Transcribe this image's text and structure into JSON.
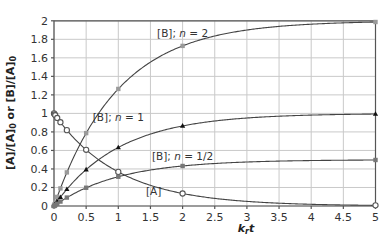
{
  "chart_data": {
    "type": "line",
    "title": "",
    "xlabel": "k_r t",
    "ylabel": "[A]/[A]0 or [B]/[A]0",
    "xlim": [
      0,
      5
    ],
    "ylim": [
      0,
      2
    ],
    "grid": true,
    "legend_position": "none (inline annotations)",
    "x_ticks": [
      "0",
      "0.5",
      "1",
      "1.5",
      "2",
      "2.5",
      "3",
      "3.5",
      "4",
      "4.5",
      "5"
    ],
    "y_ticks": [
      "0",
      "0.2",
      "0.4",
      "0.6",
      "0.8",
      "1",
      "1.2",
      "1.4",
      "1.6",
      "1.8",
      "2"
    ],
    "x": [
      0,
      0.01,
      0.02,
      0.05,
      0.1,
      0.2,
      0.5,
      1,
      2,
      5
    ],
    "series": [
      {
        "name": "[A]",
        "marker": "open-circle",
        "color": "#555555",
        "values": [
          1.0,
          0.99,
          0.98,
          0.951,
          0.905,
          0.819,
          0.607,
          0.368,
          0.135,
          0.007
        ]
      },
      {
        "name": "[B]; n = 2",
        "marker": "grey-square",
        "color": "#9a9a9a",
        "values": [
          0,
          0.02,
          0.04,
          0.098,
          0.19,
          0.363,
          0.787,
          1.264,
          1.729,
          1.987
        ]
      },
      {
        "name": "[B]; n = 1",
        "marker": "black-triangle",
        "color": "#111111",
        "values": [
          0,
          0.01,
          0.02,
          0.049,
          0.095,
          0.181,
          0.393,
          0.632,
          0.865,
          0.993
        ]
      },
      {
        "name": "[B]; n = 1/2",
        "marker": "grey-square",
        "color": "#777777",
        "values": [
          0,
          0.005,
          0.01,
          0.024,
          0.048,
          0.091,
          0.197,
          0.316,
          0.432,
          0.497
        ]
      }
    ],
    "annotations": [
      {
        "text": "[B]; n = 2",
        "x": 2.0,
        "y": 1.82
      },
      {
        "text": "[B]; n = 1",
        "x": 1.0,
        "y": 0.92
      },
      {
        "text": "[B]; n = 1/2",
        "x": 2.0,
        "y": 0.5
      },
      {
        "text": "[A]",
        "x": 1.55,
        "y": 0.12
      }
    ]
  },
  "labels": {
    "xlabel_main": "k",
    "xlabel_sub": "r",
    "xlabel_tail": "t",
    "ylabel_a": "[A]/[A]",
    "ylabel_sub0": "0",
    "ylabel_or": " or [B]/[A]",
    "ylabel_sub1": "0"
  }
}
